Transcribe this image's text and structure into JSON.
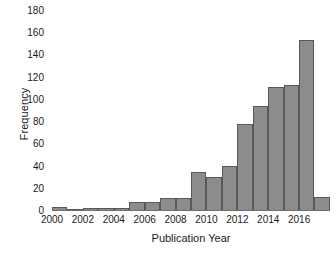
{
  "chart_data": {
    "type": "bar",
    "title": "",
    "subtitle": "",
    "xlabel": "Publication Year",
    "ylabel": "Frequency",
    "categories": [
      2000,
      2001,
      2002,
      2003,
      2004,
      2005,
      2006,
      2007,
      2008,
      2009,
      2010,
      2011,
      2012,
      2013,
      2014,
      2015,
      2016,
      2017
    ],
    "values": [
      3,
      1,
      2,
      2,
      2,
      7,
      7,
      11,
      11,
      34,
      30,
      40,
      78,
      94,
      111,
      113,
      154,
      12
    ],
    "series": [
      {
        "name": "Frequency",
        "values": [
          3,
          1,
          2,
          2,
          2,
          7,
          7,
          11,
          11,
          34,
          30,
          40,
          78,
          94,
          111,
          113,
          154,
          12
        ]
      }
    ],
    "xlim": [
      2000,
      2018
    ],
    "ylim": [
      0,
      180
    ],
    "ytick_labels": [
      "180",
      "160",
      "140",
      "120",
      "100",
      "80",
      "60",
      "40",
      "20",
      "0"
    ],
    "ytick_values": [
      180,
      160,
      140,
      120,
      100,
      80,
      60,
      40,
      20,
      0
    ],
    "xtick_labels": [
      "2000",
      "2002",
      "2004",
      "2006",
      "2008",
      "2010",
      "2012",
      "2014",
      "2016"
    ],
    "xtick_values": [
      2000,
      2002,
      2004,
      2006,
      2008,
      2010,
      2012,
      2014,
      2016
    ],
    "grid": false,
    "legend": null,
    "bar_fill_color": "#8c8c8c",
    "bar_edge_color": "#595959",
    "axis_color": "#6e6e6e",
    "text_color": "#1a1a1a",
    "background_color": "#ffffff"
  }
}
